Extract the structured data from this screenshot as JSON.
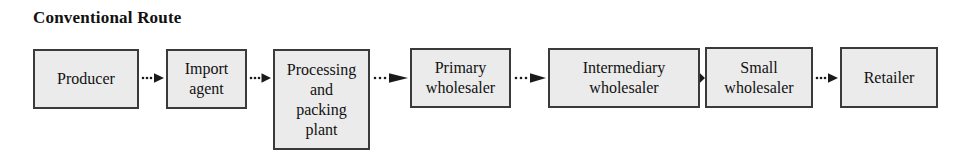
{
  "diagram": {
    "title": "Conventional Route",
    "type": "flow-chain",
    "orientation": "left-to-right",
    "background_color": "#ffffff",
    "node_fill_color": "#ebebeb",
    "node_border_color": "#3a3a3a",
    "text_color": "#111111",
    "connector_style": "dotted-line-with-solid-arrowhead",
    "nodes": [
      {
        "id": "producer",
        "label": "Producer"
      },
      {
        "id": "import-agent",
        "label": "Import\nagent"
      },
      {
        "id": "processing-packing-plant",
        "label": "Processing\nand\npacking\nplant"
      },
      {
        "id": "primary-wholesaler",
        "label": "Primary\nwholesaler"
      },
      {
        "id": "intermediary-wholesaler",
        "label": "Intermediary\nwholesaler"
      },
      {
        "id": "small-wholesaler",
        "label": "Small\nwholesaler"
      },
      {
        "id": "retailer",
        "label": "Retailer"
      }
    ],
    "connectors": [
      {
        "id": "producer-to-import-agent",
        "from": "producer",
        "to": "import-agent"
      },
      {
        "id": "import-agent-to-processing-packing-plant",
        "from": "import-agent",
        "to": "processing-packing-plant"
      },
      {
        "id": "processing-packing-plant-to-primary-wholesaler",
        "from": "processing-packing-plant",
        "to": "primary-wholesaler"
      },
      {
        "id": "primary-wholesaler-to-intermediary-wholesaler",
        "from": "primary-wholesaler",
        "to": "intermediary-wholesaler"
      },
      {
        "id": "intermediary-wholesaler-to-small-wholesaler",
        "from": "intermediary-wholesaler",
        "to": "small-wholesaler"
      },
      {
        "id": "small-wholesaler-to-retailer",
        "from": "small-wholesaler",
        "to": "retailer"
      }
    ]
  }
}
